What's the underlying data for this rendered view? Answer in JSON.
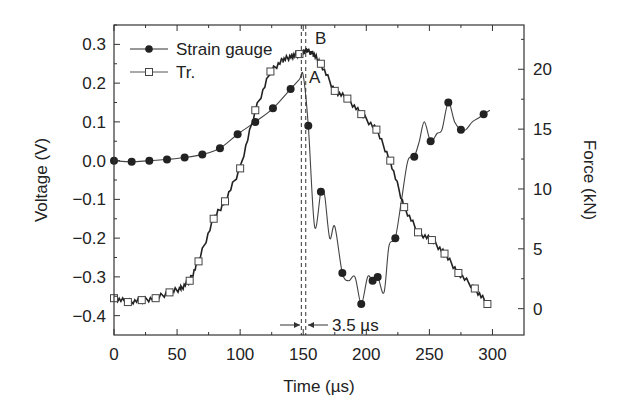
{
  "chart_data": {
    "type": "line",
    "title": "",
    "xlabel": "Time (µs)",
    "ylabel": "Voltage (V)",
    "y2label": "Force (kN)",
    "xlim": [
      0,
      325
    ],
    "ylim": [
      -0.45,
      0.35
    ],
    "y2lim": [
      -2.2,
      23.7
    ],
    "grid": false,
    "legend_position": "upper-left",
    "x_ticks": [
      0,
      50,
      100,
      150,
      200,
      250,
      300
    ],
    "x_tick_labels": [
      "0",
      "50",
      "100",
      "150",
      "200",
      "250",
      "300"
    ],
    "y_ticks": [
      0.3,
      0.2,
      0.1,
      0.0,
      -0.1,
      -0.2,
      -0.3,
      -0.4
    ],
    "y_tick_labels": [
      "0.3",
      "0.2",
      "0.1",
      "0.0",
      "−0.1",
      "−0.2",
      "−0.3",
      "−0.4"
    ],
    "y2_ticks": [
      20,
      15,
      10,
      5,
      0
    ],
    "y2_tick_labels": [
      "20",
      "15",
      "10",
      "5",
      "0"
    ],
    "series": [
      {
        "name": "Strain gauge",
        "axis": "left",
        "marker": "filled-circle",
        "x": [
          0,
          14,
          28,
          42,
          56,
          70,
          84,
          98,
          112,
          126,
          140,
          147,
          150,
          154,
          159,
          164,
          167,
          171,
          175,
          181,
          186,
          191,
          196,
          201,
          205,
          209,
          214,
          218,
          223,
          228,
          233,
          238,
          242,
          246,
          251,
          256,
          260,
          265,
          270,
          275,
          279,
          284,
          289,
          293,
          298
        ],
        "values": [
          0.0,
          -0.003,
          0.0,
          0.003,
          0.008,
          0.016,
          0.032,
          0.068,
          0.1,
          0.135,
          0.185,
          0.21,
          0.22,
          0.09,
          -0.17,
          -0.08,
          -0.09,
          -0.2,
          -0.17,
          -0.29,
          -0.31,
          -0.3,
          -0.37,
          -0.3,
          -0.31,
          -0.3,
          -0.34,
          -0.22,
          -0.2,
          -0.1,
          0.0,
          0.01,
          0.05,
          0.1,
          0.05,
          0.07,
          0.08,
          0.15,
          0.1,
          0.08,
          0.08,
          0.1,
          0.11,
          0.12,
          0.13
        ]
      },
      {
        "name": "Tr.",
        "axis": "left",
        "marker": "open-square",
        "x": [
          0,
          11,
          22,
          33,
          44,
          53,
          60,
          67,
          79,
          88,
          100,
          112,
          124,
          134,
          141,
          147,
          150,
          153,
          158,
          164,
          175,
          185,
          196,
          208,
          219,
          230,
          241,
          252,
          262,
          273,
          286,
          296
        ],
        "values": [
          -0.355,
          -0.365,
          -0.36,
          -0.355,
          -0.34,
          -0.33,
          -0.31,
          -0.26,
          -0.15,
          -0.105,
          -0.02,
          0.13,
          0.23,
          0.26,
          0.27,
          0.275,
          0.28,
          0.285,
          0.275,
          0.25,
          0.18,
          0.16,
          0.12,
          0.08,
          0.0,
          -0.12,
          -0.185,
          -0.205,
          -0.24,
          -0.29,
          -0.33,
          -0.37
        ]
      }
    ],
    "annotations": [
      {
        "text": "A",
        "x": 154,
        "y": 0.22
      },
      {
        "text": "B",
        "x": 157,
        "y": 0.3
      },
      {
        "text": "3.5 µs",
        "x": 165,
        "y": -0.415,
        "note": "interval between dashed lines at ~148.5 and ~152 µs"
      }
    ],
    "dashed_vertical_lines_x": [
      148.5,
      152
    ]
  },
  "legend": {
    "items": [
      {
        "label": "Strain gauge"
      },
      {
        "label": "Tr."
      }
    ]
  },
  "labels": {
    "xlabel": "Time (µs)",
    "ylabel": "Voltage (V)",
    "y2label": "Force (kN)",
    "annotation_a": "A",
    "annotation_b": "B",
    "annotation_interval": "3.5 µs"
  }
}
